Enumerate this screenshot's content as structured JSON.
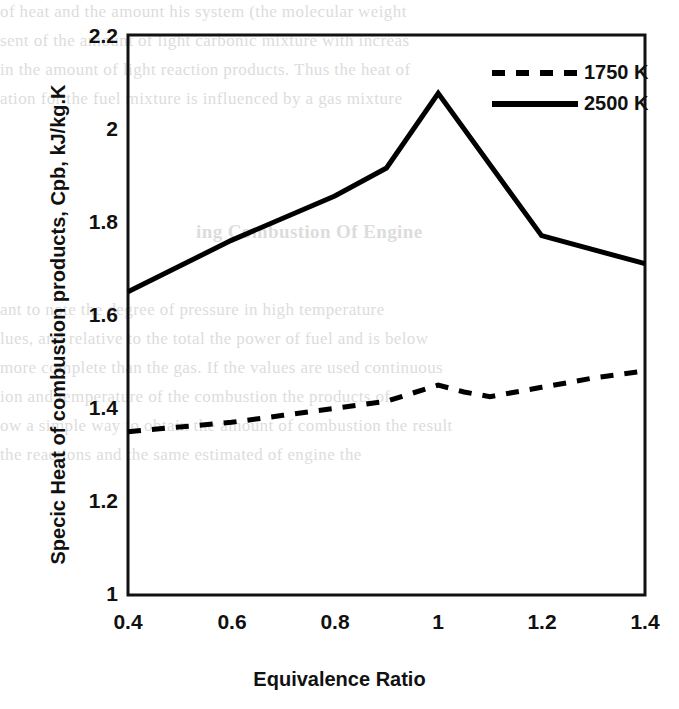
{
  "chart_data": {
    "type": "line",
    "title": "",
    "xlabel": "Equivalence Ratio",
    "ylabel": "Specic Heat of combustion products, Cpb, kJ/kg.K",
    "xlim": [
      0.4,
      1.4
    ],
    "ylim": [
      1,
      2.2
    ],
    "xticks": [
      "0.4",
      "0.6",
      "0.8",
      "1",
      "1.2",
      "1.4"
    ],
    "xtick_values": [
      0.4,
      0.6,
      0.8,
      1.0,
      1.2,
      1.4
    ],
    "yticks": [
      "1",
      "1.2",
      "1.4",
      "1.6",
      "1.8",
      "2",
      "2.2"
    ],
    "ytick_values": [
      1,
      1.2,
      1.4,
      1.6,
      1.8,
      2.0,
      2.2
    ],
    "grid": false,
    "legend_position": "top-right",
    "series": [
      {
        "name": "1750 K",
        "style": "dashed",
        "color": "#000000",
        "x": [
          0.4,
          0.5,
          0.6,
          0.7,
          0.8,
          0.9,
          1.0,
          1.05,
          1.1,
          1.2,
          1.3,
          1.4
        ],
        "values": [
          1.35,
          1.36,
          1.37,
          1.385,
          1.4,
          1.415,
          1.45,
          1.435,
          1.425,
          1.445,
          1.465,
          1.48
        ]
      },
      {
        "name": "2500 K",
        "style": "solid",
        "color": "#000000",
        "x": [
          0.4,
          0.6,
          0.8,
          0.9,
          1.0,
          1.2,
          1.4
        ],
        "values": [
          1.65,
          1.76,
          1.855,
          1.915,
          2.075,
          1.77,
          1.71
        ]
      }
    ]
  },
  "legend": {
    "entries": [
      {
        "label": "1750 K",
        "style": "dashed"
      },
      {
        "label": "2500 K",
        "style": "solid"
      }
    ]
  },
  "axes": {
    "x_title": "Equivalence Ratio",
    "y_title": "Specic Heat of combustion products, Cpb, kJ/kg.K",
    "x_tick_labels": [
      "0.4",
      "0.6",
      "0.8",
      "1",
      "1.2",
      "1.4"
    ],
    "y_tick_labels": [
      "2.2",
      "2",
      "1.8",
      "1.6",
      "1.4",
      "1.2",
      "1"
    ]
  },
  "background_text": {
    "top_lines": [
      "of heat and the amount his system (the molecular weight",
      "sent of the amount of light carbonic mixture  with increas",
      "in the amount of light reaction products.  Thus the heat of",
      "ation for the fuel mixture  is influenced by a gas mixture"
    ],
    "mid_heading": "ing Combustion Of Engine",
    "mid_lines": [
      "ant to note the degree of pressure  in high temperature",
      "lues, and relative to the total the power  of fuel  and is below",
      "more complete than the gas. If the  values are used continuous",
      "ion and temperature  of the combustion  the products of",
      "ow a simple way to obtain the amount of  combustion the result",
      "the  reactions and  the  same  estimated  of  engine  the"
    ]
  }
}
